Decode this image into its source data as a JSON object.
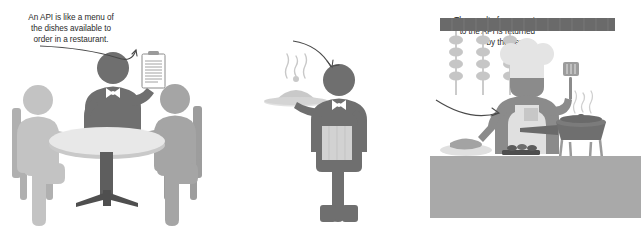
{
  "figure": {
    "background_color": "#ffffff",
    "panels": [
      {
        "name": "restaurant-table",
        "caption": "An API is like a menu of\nthe dishes available to\norder in a restaurant.",
        "elements": [
          "waiter-with-menu",
          "seated-customer-left",
          "seated-customer-right",
          "round-table",
          "chair-left",
          "chair-right",
          "curved-arrow-to-menu"
        ]
      },
      {
        "name": "waiter-serving",
        "caption": "The result of a request\nto the API is returned\nby the server.",
        "elements": [
          "waiter-with-tray",
          "covered-dish-cloche",
          "steam",
          "apron-towel",
          "curved-arrow-to-waiter"
        ]
      },
      {
        "name": "kitchen-chef",
        "caption": "Just like a chef in a\nrestaurant, the computer\nhosting the API carries\nout the actual work.",
        "elements": [
          "chef",
          "chef-hat",
          "spatula",
          "apron",
          "hanging-skewers",
          "ceiling-rail",
          "frying-pan",
          "burner-stand",
          "counter",
          "cutting-board",
          "food-items",
          "curved-arrow-to-chef"
        ]
      }
    ]
  },
  "captions": {
    "api_menu": "An API is like a menu of\nthe dishes available to\norder in a restaurant.",
    "response_server": "The result of a request\nto the API is returned\nby the server.",
    "chef_work": "Just like a chef in a\nrestaurant, the computer\nhosting the API carries\nout the actual work."
  },
  "colors": {
    "text": "#2b2b2b",
    "arrow": "#4a4a4a",
    "figure_light": "#c3c3c3",
    "figure_medium": "#9a9a9a",
    "figure_dark": "#6f6f6f",
    "figure_darkest": "#595959",
    "table_top": "#e8e8e8",
    "table_edge": "#c9c9c9",
    "counter": "#a9a9a9",
    "rail": "#6a6a6a",
    "hat": "#e4e4e4",
    "white": "#ffffff"
  },
  "icon_names": [
    "menu-clipboard-icon",
    "covered-dish-icon",
    "steam-icon",
    "chef-hat-icon",
    "spatula-icon",
    "skewer-icon",
    "frying-pan-icon",
    "curved-arrow-icon",
    "bowtie-icon"
  ]
}
